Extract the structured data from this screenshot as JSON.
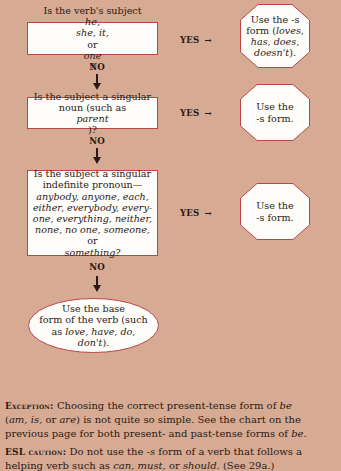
{
  "flowchart": {
    "questions": [
      {
        "lines": [
          [
            {
              "t": "Is the verb's subject "
            },
            {
              "t": "he,",
              "i": true
            }
          ],
          [
            {
              "t": "she, it,",
              "i": true
            },
            {
              "t": " or "
            },
            {
              "t": "one",
              "i": true
            },
            {
              "t": "?"
            }
          ]
        ],
        "yes_label": "YES",
        "no_label": "NO",
        "result_lines": [
          [
            {
              "t": "Use the -s"
            }
          ],
          [
            {
              "t": "form ("
            },
            {
              "t": "loves,",
              "i": true
            }
          ],
          [
            {
              "t": "has, does,",
              "i": true
            }
          ],
          [
            {
              "t": "doesn't",
              "i": true
            },
            {
              "t": ")."
            }
          ]
        ]
      },
      {
        "lines": [
          [
            {
              "t": "Is the subject a singular"
            }
          ],
          [
            {
              "t": "noun (such as "
            },
            {
              "t": "parent",
              "i": true
            },
            {
              "t": ")?"
            }
          ]
        ],
        "yes_label": "YES",
        "no_label": "NO",
        "result_lines": [
          [
            {
              "t": "Use the"
            }
          ],
          [
            {
              "t": "-s form."
            }
          ]
        ]
      },
      {
        "lines": [
          [
            {
              "t": "Is the subject a singular"
            }
          ],
          [
            {
              "t": "indefinite pronoun—"
            }
          ],
          [
            {
              "t": "anybody, anyone, each,",
              "i": true
            }
          ],
          [
            {
              "t": "either, everybody, every-",
              "i": true
            }
          ],
          [
            {
              "t": "one, everything, neither,",
              "i": true
            }
          ],
          [
            {
              "t": "none, no one, someone,",
              "i": true
            },
            {
              "t": " or"
            }
          ],
          [
            {
              "t": "something?",
              "i": true
            }
          ]
        ],
        "yes_label": "YES",
        "no_label": "NO",
        "result_lines": [
          [
            {
              "t": "Use the"
            }
          ],
          [
            {
              "t": "-s form."
            }
          ]
        ]
      }
    ],
    "final_lines": [
      [
        {
          "t": "Use the base"
        }
      ],
      [
        {
          "t": "form of the verb (such"
        }
      ],
      [
        {
          "t": "as "
        },
        {
          "t": "love, have, do,",
          "i": true
        }
      ],
      [
        {
          "t": "don't",
          "i": true
        },
        {
          "t": ")."
        }
      ]
    ],
    "yes_arrow": "→",
    "no_arrow": "down-arrow"
  },
  "notes": [
    {
      "label": "Exception:",
      "lines": [
        [
          {
            "t": "Choosing the correct present-tense form of "
          },
          {
            "t": "be",
            "i": true
          }
        ],
        [
          {
            "t": "("
          },
          {
            "t": "am, is,",
            "i": true
          },
          {
            "t": " or "
          },
          {
            "t": "are",
            "i": true
          },
          {
            "t": ") is not quite so simple. See the chart on the"
          }
        ],
        [
          {
            "t": "previous page for both present- and past-tense forms of "
          },
          {
            "t": "be",
            "i": true
          },
          {
            "t": "."
          }
        ]
      ]
    },
    {
      "label": "ESL caution:",
      "lines": [
        [
          {
            "t": "Do not use the -"
          },
          {
            "t": "s",
            "i": true
          },
          {
            "t": " form of a verb that follows a"
          }
        ],
        [
          {
            "t": "helping verb such as "
          },
          {
            "t": "can, must,",
            "i": true
          },
          {
            "t": " or "
          },
          {
            "t": "should.",
            "i": true
          },
          {
            "t": " (See 29a.)"
          }
        ]
      ]
    }
  ],
  "colors": {
    "background": "#d7aa93",
    "box_fill": "#fffdfa",
    "box_border": "#b9474a",
    "text": "#2a1a14"
  }
}
